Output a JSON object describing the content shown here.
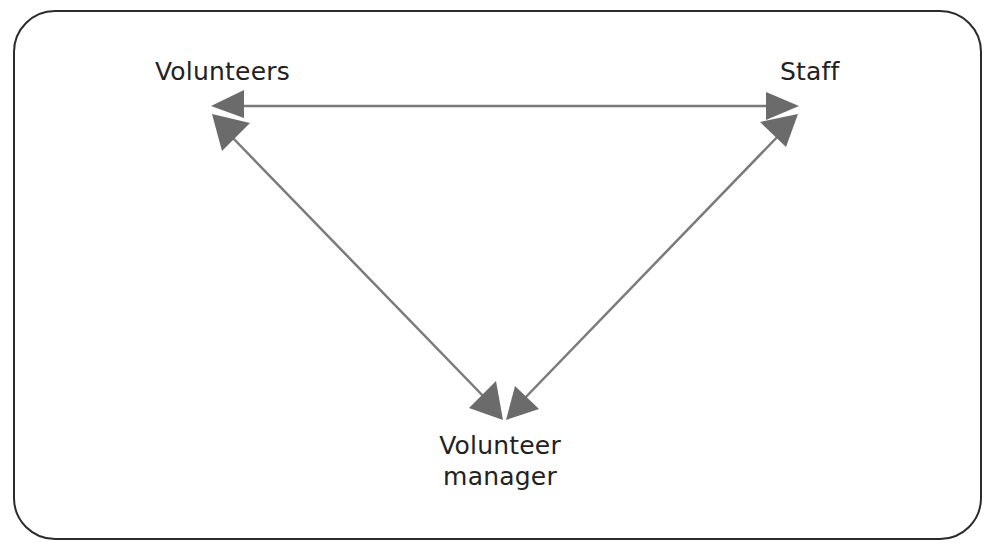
{
  "diagram": {
    "nodes": [
      {
        "id": "volunteers",
        "label": "Volunteers"
      },
      {
        "id": "staff",
        "label": "Staff"
      },
      {
        "id": "volunteer_manager",
        "label_line1": "Volunteer",
        "label_line2": "manager"
      }
    ],
    "edges": [
      {
        "from": "volunteers",
        "to": "staff",
        "direction": "bidirectional"
      },
      {
        "from": "volunteers",
        "to": "volunteer_manager",
        "direction": "bidirectional"
      },
      {
        "from": "staff",
        "to": "volunteer_manager",
        "direction": "bidirectional"
      }
    ],
    "colors": {
      "frame": "#2b2b2b",
      "arrow_line": "#7a7a7a",
      "arrow_head": "#6b6b6b",
      "text": "#222222"
    }
  }
}
